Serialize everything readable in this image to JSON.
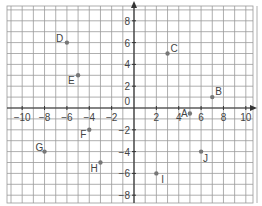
{
  "chart_data": {
    "type": "scatter",
    "title": "",
    "xlabel": "",
    "ylabel": "",
    "xlim": [
      -11,
      11
    ],
    "ylim": [
      -8.7,
      9.4
    ],
    "grid": true,
    "x_ticks": [
      -10,
      -8,
      -6,
      -4,
      -2,
      2,
      4,
      6,
      8,
      10
    ],
    "y_ticks": [
      8,
      6,
      4,
      2,
      -2,
      -4,
      -6,
      -8
    ],
    "origin_label": "0",
    "points": [
      {
        "label": "A",
        "x": 5,
        "y": -0.5
      },
      {
        "label": "B",
        "x": 7,
        "y": 1
      },
      {
        "label": "C",
        "x": 3,
        "y": 5
      },
      {
        "label": "D",
        "x": -6,
        "y": 6
      },
      {
        "label": "E",
        "x": -5,
        "y": 3
      },
      {
        "label": "F",
        "x": -4,
        "y": -2
      },
      {
        "label": "G",
        "x": -8,
        "y": -4
      },
      {
        "label": "H",
        "x": -3,
        "y": -5
      },
      {
        "label": "I",
        "x": 2,
        "y": -6
      },
      {
        "label": "J",
        "x": 6,
        "y": -4
      }
    ]
  },
  "colors": {
    "grid": "#9a9a9a",
    "axis": "#333333",
    "point": "#777777",
    "text": "#444444"
  }
}
